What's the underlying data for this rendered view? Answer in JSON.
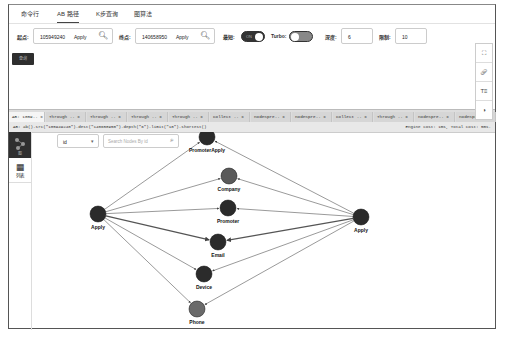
{
  "nav": {
    "tabs": [
      {
        "label": "命令行",
        "active": false
      },
      {
        "label": "AB 路径",
        "active": true
      },
      {
        "label": "K步查询",
        "active": false
      },
      {
        "label": "图算法",
        "active": false
      }
    ]
  },
  "query_form": {
    "start_label": "起点:",
    "start_value": "105949240",
    "start_apply": "Apply",
    "end_label": "终点:",
    "end_value": "140658950",
    "end_apply": "Apply",
    "shortest_label": "最短:",
    "shortest_toggle": "ON",
    "turbo_label": "Turbo:",
    "turbo_toggle": "OFF",
    "depth_label": "深度:",
    "depth_value": "6",
    "limit_label": "限制:",
    "limit_value": "10",
    "run_button": "查询"
  },
  "query_tabs": [
    {
      "label": "AB: 1059.. x",
      "active": true
    },
    {
      "label": "Through .. x"
    },
    {
      "label": "Through .. x"
    },
    {
      "label": "Through .. x"
    },
    {
      "label": "Through .. x"
    },
    {
      "label": "Collect .. x"
    },
    {
      "label": "nodeSpre.. x"
    },
    {
      "label": "nodeSpre.. x"
    },
    {
      "label": "Collect .. x"
    },
    {
      "label": "Through .. x"
    },
    {
      "label": "nodeSpre.. x"
    },
    {
      "label": "nodeSpre.. x"
    }
  ],
  "query_bar": {
    "query": "AB: ab().src(\"105949240\").dest(\"140658950\").depth(\"6\").limit(\"10\").shortest()",
    "cost": "Engine cost: 1ms, Total cost: 5ms."
  },
  "sidebar": {
    "items": [
      {
        "label": "图",
        "icon": "graph-icon",
        "active": true
      },
      {
        "label": "列表",
        "icon": "table-icon",
        "active": false
      }
    ]
  },
  "graph_toolbar": {
    "select_value": "id",
    "search_placeholder": "Search Nodes By id"
  },
  "graph_tools": [
    "fullscreen-icon",
    "link-icon",
    "text-icon",
    "snapshot-icon"
  ],
  "graph": {
    "nodes": [
      {
        "id": "applyL",
        "label": "Apply",
        "x": 67,
        "y": 82,
        "color": "#2b2b2b"
      },
      {
        "id": "applyR",
        "label": "Apply",
        "x": 330,
        "y": 85,
        "color": "#2b2b2b"
      },
      {
        "id": "pa",
        "label": "PromoterApply",
        "x": 176,
        "y": 5,
        "color": "#2b2b2b"
      },
      {
        "id": "company",
        "label": "Company",
        "x": 198,
        "y": 44,
        "color": "#5a5a5a"
      },
      {
        "id": "promoter",
        "label": "Promoter",
        "x": 197,
        "y": 76,
        "color": "#2b2b2b"
      },
      {
        "id": "email",
        "label": "Email",
        "x": 187,
        "y": 110,
        "color": "#2b2b2b"
      },
      {
        "id": "device",
        "label": "Device",
        "x": 173,
        "y": 142,
        "color": "#2b2b2b"
      },
      {
        "id": "phone",
        "label": "Phone",
        "x": 166,
        "y": 177,
        "color": "#6a6a6a"
      }
    ]
  }
}
